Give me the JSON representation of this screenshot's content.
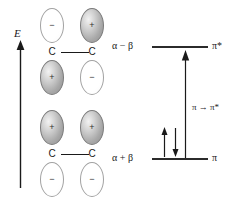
{
  "figure": {
    "axis": {
      "label": "E",
      "name": "energy-axis",
      "direction": "up"
    },
    "orbitals": [
      {
        "id": "antibonding",
        "name": "pi-star-orbital",
        "atoms": [
          "C",
          "C"
        ],
        "top_lobes": [
          {
            "sign": "−",
            "shaded": false
          },
          {
            "sign": "+",
            "shaded": true
          }
        ],
        "bottom_lobes": [
          {
            "sign": "+",
            "shaded": true
          },
          {
            "sign": "−",
            "shaded": false
          }
        ]
      },
      {
        "id": "bonding",
        "name": "pi-orbital",
        "atoms": [
          "C",
          "C"
        ],
        "top_lobes": [
          {
            "sign": "+",
            "shaded": true
          },
          {
            "sign": "+",
            "shaded": true
          }
        ],
        "bottom_lobes": [
          {
            "sign": "−",
            "shaded": false
          },
          {
            "sign": "−",
            "shaded": false
          }
        ]
      }
    ],
    "levels": [
      {
        "id": "antibonding",
        "energy_term": "α − β",
        "orbital_label": "π*",
        "occupancy": 0,
        "electrons": []
      },
      {
        "id": "bonding",
        "energy_term": "α + β",
        "orbital_label": "π",
        "occupancy": 2,
        "electrons": [
          "up",
          "down"
        ]
      }
    ],
    "transition": {
      "label": "π → π*",
      "from": "π",
      "to": "π*",
      "arrow_direction": "up"
    },
    "colors": {
      "line": "#2b2b2b",
      "text": "#1a1a1a",
      "lobe_shaded": "#a8a8a8",
      "lobe_outline": "#8d8d8d",
      "background": "#ffffff"
    }
  }
}
